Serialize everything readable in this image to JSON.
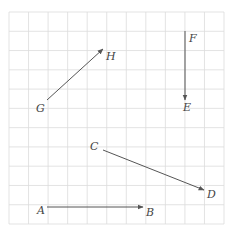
{
  "diagram": {
    "type": "vector-grid",
    "grid": {
      "x0": 9,
      "y0": 12,
      "x1": 224,
      "y1": 224,
      "cols": 11,
      "rows": 11,
      "line_color": "#dcdcdc"
    },
    "vector_color": "#555555",
    "vectors": [
      {
        "id": "GH",
        "from": {
          "label": "G",
          "x": 47,
          "y": 100,
          "lx": 36,
          "ly": 112
        },
        "to": {
          "label": "H",
          "x": 103,
          "y": 49,
          "lx": 106,
          "ly": 60
        }
      },
      {
        "id": "FE",
        "from": {
          "label": "F",
          "x": 185,
          "y": 31,
          "lx": 189,
          "ly": 42
        },
        "to": {
          "label": "E",
          "x": 185,
          "y": 100,
          "lx": 183,
          "ly": 111
        }
      },
      {
        "id": "CD",
        "from": {
          "label": "C",
          "x": 103,
          "y": 150,
          "lx": 90,
          "ly": 150
        },
        "to": {
          "label": "D",
          "x": 204,
          "y": 190,
          "lx": 207,
          "ly": 198
        }
      },
      {
        "id": "AB",
        "from": {
          "label": "A",
          "x": 47,
          "y": 207,
          "lx": 37,
          "ly": 214
        },
        "to": {
          "label": "B",
          "x": 143,
          "y": 207,
          "lx": 146,
          "ly": 216
        }
      }
    ]
  }
}
